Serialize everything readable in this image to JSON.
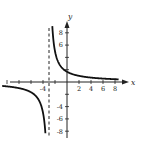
{
  "chart_data": {
    "type": "line",
    "title": "",
    "xlabel": "x",
    "ylabel": "y",
    "function": "y = 5/(x+3)",
    "xlim": [
      -11,
      9.5
    ],
    "ylim": [
      -9,
      10
    ],
    "x_tick_labels": [
      "-4",
      "2",
      "4",
      "6",
      "8"
    ],
    "y_tick_labels": [
      "8",
      "6",
      "-4",
      "-6",
      "-8"
    ],
    "x_ticks": [
      -10,
      -8,
      -6,
      -4,
      -2,
      2,
      4,
      6,
      8
    ],
    "y_ticks": [
      -8,
      -6,
      -4,
      -2,
      2,
      4,
      6,
      8
    ],
    "vertical_asymptote": -3,
    "horizontal_asymptote": 0,
    "grid": false,
    "legend": "none",
    "series": [
      {
        "name": "right branch",
        "x": [
          -2.45,
          -2.2,
          -2,
          -1.5,
          -1,
          0,
          1,
          2,
          4,
          6,
          8
        ],
        "values": [
          9.09,
          6.25,
          5.0,
          3.33,
          2.5,
          1.67,
          1.25,
          1.0,
          0.71,
          0.56,
          0.45
        ]
      },
      {
        "name": "left branch",
        "x": [
          -9,
          -8,
          -7,
          -6,
          -5,
          -4,
          -3.6
        ],
        "values": [
          -0.83,
          -1.0,
          -1.25,
          -1.67,
          -2.5,
          -5.0,
          -8.33
        ]
      }
    ]
  }
}
